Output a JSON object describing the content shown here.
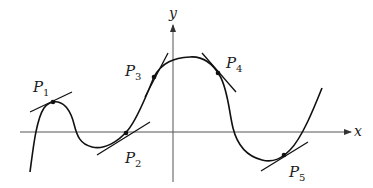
{
  "figure": {
    "type": "function-graph-with-tangent-lines",
    "axes": {
      "x_label": "x",
      "y_label": "y"
    },
    "points": [
      {
        "name": "P",
        "sub": "1",
        "x": 53,
        "y": 102,
        "label_x": 33,
        "label_y": 80
      },
      {
        "name": "P",
        "sub": "2",
        "x": 126,
        "y": 133,
        "label_x": 126,
        "label_y": 163
      },
      {
        "name": "P",
        "sub": "3",
        "x": 154,
        "y": 77,
        "label_x": 125,
        "label_y": 77
      },
      {
        "name": "P",
        "sub": "4",
        "x": 218,
        "y": 73,
        "label_x": 226,
        "label_y": 69
      },
      {
        "name": "P",
        "sub": "5",
        "x": 284,
        "y": 155,
        "label_x": 290,
        "label_y": 178
      }
    ],
    "colors": {
      "curve": "#111111",
      "axes": "#333333",
      "background": "#ffffff"
    }
  }
}
